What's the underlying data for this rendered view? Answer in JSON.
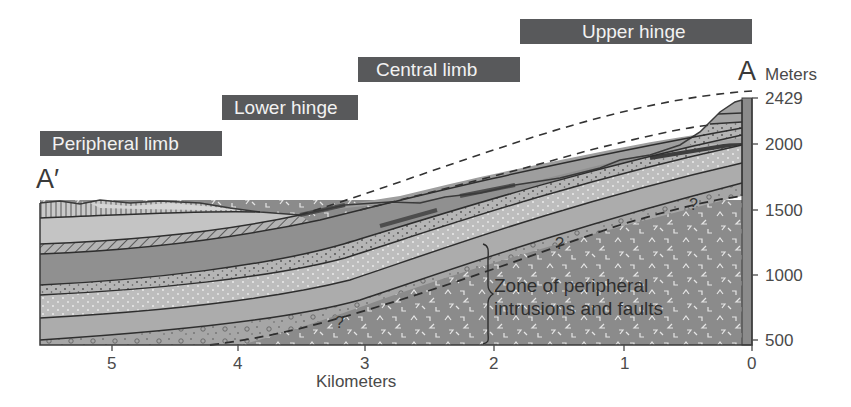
{
  "diagram": {
    "type": "geologic-cross-section",
    "zones": [
      {
        "label": "Peripheral limb"
      },
      {
        "label": "Lower hinge"
      },
      {
        "label": "Central limb"
      },
      {
        "label": "Upper hinge"
      }
    ],
    "section_ends": {
      "left": "A′",
      "right": "A"
    },
    "x_axis": {
      "title": "Kilometers",
      "ticks": [
        "5",
        "4",
        "3",
        "2",
        "1",
        "0"
      ]
    },
    "y_axis": {
      "title": "Meters",
      "ticks": [
        "2429",
        "2000",
        "1500",
        "1000",
        "500"
      ]
    },
    "annotation": {
      "line1": "Zone of peripheral",
      "line2": "intrusions and faults"
    },
    "uncertain_contact_marks": [
      "?",
      "?",
      "?",
      "?"
    ],
    "colors": {
      "label_box": "#58595b",
      "label_text": "#f2f2f2",
      "basement": "#8a8a8a",
      "dark_layer": "#8e8e8e",
      "medium_layer": "#a9a9a9",
      "light_layer": "#c2c2c2",
      "dotted_layer": "#b7b7b7"
    }
  }
}
